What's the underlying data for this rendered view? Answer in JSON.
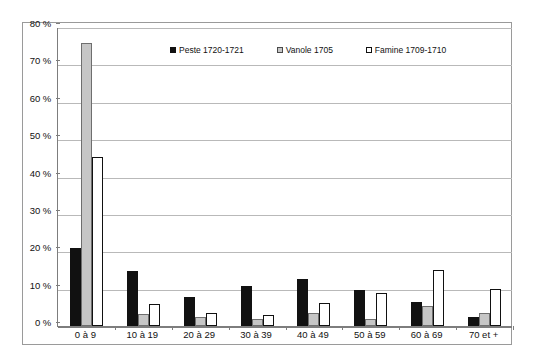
{
  "chart_data": {
    "type": "bar",
    "title": "",
    "subtitle": "",
    "xlabel": "",
    "ylabel": "",
    "ylim": [
      0,
      80
    ],
    "ytick_values": [
      0,
      10,
      20,
      30,
      40,
      50,
      60,
      70,
      80
    ],
    "ytick_labels": [
      "0 %",
      "10 %",
      "20 %",
      "30 %",
      "40 %",
      "50 %",
      "60 %",
      "70 %",
      "80 %"
    ],
    "grid": true,
    "grid_axis": "y",
    "legend_position": "inside-top-center",
    "categories": [
      "0 à 9",
      "10 à 19",
      "20 à 29",
      "30 à 39",
      "40 à 49",
      "50 à 59",
      "60 à 69",
      "70 et +"
    ],
    "series": [
      {
        "name": "Peste 1720-1721",
        "color": "#111111",
        "swatch": "filled-black",
        "values": [
          20.8,
          14.8,
          7.8,
          10.7,
          12.6,
          9.7,
          6.5,
          2.3
        ]
      },
      {
        "name": "Vanole 1705",
        "color": "#c6c6c6",
        "swatch": "filled-gray",
        "values": [
          75.7,
          3.3,
          2.5,
          1.8,
          3.5,
          1.9,
          5.3,
          3.4
        ]
      },
      {
        "name": "Famine 1709-1710",
        "color": "#ffffff",
        "swatch": "outline-white",
        "values": [
          45.3,
          5.8,
          3.6,
          2.9,
          6.1,
          8.9,
          15.0,
          10.0
        ]
      }
    ]
  },
  "legend": {
    "items": [
      {
        "label": "Peste 1720-1721"
      },
      {
        "label": "Vanole 1705"
      },
      {
        "label": "Famine 1709-1710"
      }
    ]
  }
}
